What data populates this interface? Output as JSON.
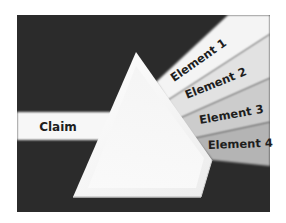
{
  "diagram": {
    "type": "prism-dispersion",
    "input": {
      "label": "Claim"
    },
    "outputs": [
      {
        "label": "Element 1",
        "color": "#f4f4f4"
      },
      {
        "label": "Element 2",
        "color": "#e2e2e2"
      },
      {
        "label": "Element 3",
        "color": "#cccccc"
      },
      {
        "label": "Element 4",
        "color": "#b4b4b4"
      }
    ],
    "colors": {
      "background": "#2b2b2b",
      "page": "#ffffff",
      "prism": "#f7f7f7",
      "input_beam": "#f7f7f7",
      "text": "#1e1e1e"
    }
  }
}
